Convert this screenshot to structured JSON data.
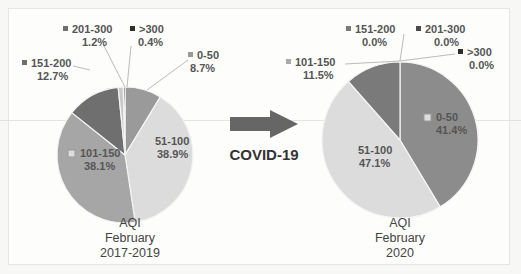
{
  "chart_data": [
    {
      "type": "pie",
      "title": "AQI February 2017-2019",
      "title_lines": [
        "AQI",
        "February",
        "2017-2019"
      ],
      "categories": [
        "0-50",
        "51-100",
        "101-150",
        "151-200",
        "201-300",
        ">300"
      ],
      "values": [
        8.7,
        38.9,
        38.1,
        12.7,
        1.2,
        0.4
      ],
      "labels": [
        "8.7%",
        "38.9%",
        "38.1%",
        "12.7%",
        "1.2%",
        "0.4%"
      ],
      "colors": [
        "#9a9a9a",
        "#dcdcdc",
        "#a6a6a6",
        "#6f6f6f",
        "#c9c9c9",
        "#2e2e2e"
      ]
    },
    {
      "type": "pie",
      "title": "AQI February 2020",
      "title_lines": [
        "AQI",
        "February",
        "2020"
      ],
      "categories": [
        "0-50",
        "51-100",
        "101-150",
        "151-200",
        "201-300",
        ">300"
      ],
      "values": [
        41.4,
        47.1,
        11.5,
        0.0,
        0.0,
        0.0
      ],
      "labels": [
        "41.4%",
        "47.1%",
        "11.5%",
        "0.0%",
        "0.0%",
        "0.0%"
      ],
      "colors": [
        "#8c8c8c",
        "#dcdcdc",
        "#7a7a7a",
        "#6f6f6f",
        "#4a4a4a",
        "#2e2e2e"
      ]
    }
  ],
  "annotation": {
    "arrow_label": "COVID-19"
  }
}
